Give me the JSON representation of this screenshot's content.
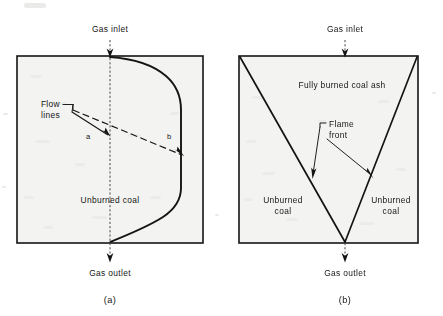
{
  "figure": {
    "background_color": "#ffffff",
    "ink_color": "#141414",
    "vessel_fill_color": "#f3f3f1"
  },
  "panels": [
    {
      "id": "a",
      "caption": "(a)",
      "inlet_label": "Gas inlet",
      "outlet_label": "Gas outlet",
      "region_label": "Unburned coal",
      "callout_label_line1": "Flow",
      "callout_label_line2": "lines",
      "flow_line_a_letter": "a",
      "flow_line_b_letter": "b",
      "vessel": {
        "x": 17,
        "y": 56,
        "width": 186,
        "height": 187
      },
      "centerline_x": 110
    },
    {
      "id": "b",
      "caption": "(b)",
      "inlet_label": "Gas inlet",
      "outlet_label": "Gas outlet",
      "ash_label": "Fully burned coal ash",
      "left_region_label_line1": "Unburned",
      "left_region_label_line2": "coal",
      "right_region_label_line1": "Unburned",
      "right_region_label_line2": "coal",
      "callout_label_line1": "Flame",
      "callout_label_line2": "front",
      "vessel": {
        "x": 239,
        "y": 56,
        "width": 179,
        "height": 187
      },
      "apex_x": 345
    }
  ]
}
